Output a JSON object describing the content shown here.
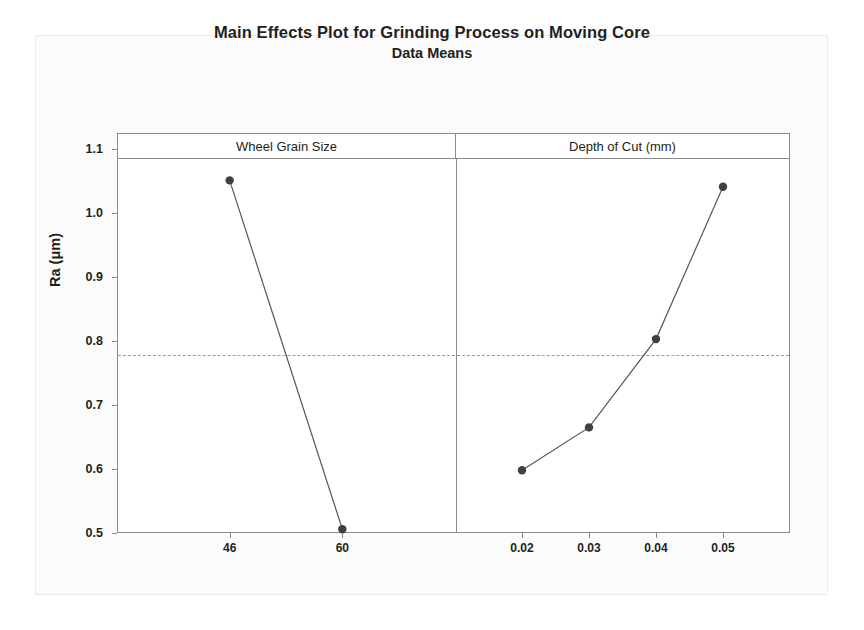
{
  "chart_data": {
    "type": "line",
    "title": "Main Effects Plot for Grinding Process on Moving Core",
    "subtitle": "Data Means",
    "ylabel": "Ra (μm)",
    "xlabel": "",
    "ylim": [
      0.45,
      1.14
    ],
    "yticks": [
      "1.1",
      "1.0",
      "0.9",
      "0.8",
      "0.7",
      "0.6",
      "0.5"
    ],
    "ytick_values": [
      1.1,
      1.0,
      0.9,
      0.8,
      0.7,
      0.6,
      0.5
    ],
    "grid": false,
    "legend": "none",
    "reference_line": {
      "label": "Grand mean",
      "value": 0.778,
      "style": "dashed",
      "color": "#9a9aa2"
    },
    "marker_color": "#3f3f46",
    "line_color": "#55555c",
    "panels": [
      {
        "name": "Wheel Grain Size",
        "categories": [
          "46",
          "60"
        ],
        "values": [
          1.051,
          0.506
        ]
      },
      {
        "name": "Depth of Cut (mm)",
        "categories": [
          "0.02",
          "0.03",
          "0.04",
          "0.05"
        ],
        "values": [
          0.598,
          0.665,
          0.803,
          1.041
        ]
      }
    ]
  }
}
